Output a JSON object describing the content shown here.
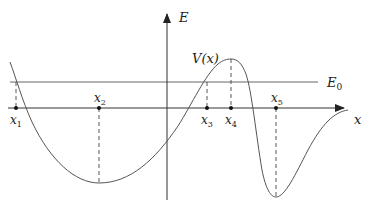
{
  "diagram": {
    "title": "",
    "axes": {
      "vertical_label": "E",
      "horizontal_label": "x"
    },
    "curve_label": "V(x)",
    "energy_level_label": "E",
    "energy_level_subscript": "0",
    "points": [
      {
        "id": "x1",
        "base": "x",
        "sub": "1"
      },
      {
        "id": "x2",
        "base": "x",
        "sub": "2"
      },
      {
        "id": "x3",
        "base": "x",
        "sub": "3"
      },
      {
        "id": "x4",
        "base": "x",
        "sub": "4"
      },
      {
        "id": "x5",
        "base": "x",
        "sub": "5"
      }
    ],
    "colors": {
      "axis": "#333333",
      "curve": "#555555",
      "energy_line": "#555555",
      "dashed": "#444444"
    }
  }
}
